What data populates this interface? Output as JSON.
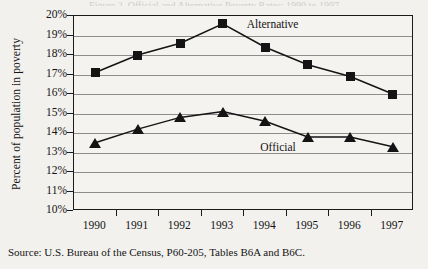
{
  "figure": {
    "title_remnant": "Figure 2. Official and Alternative Poverty Rates: 1990 to 1997",
    "source": "Source: U.S. Bureau of the Census, P60-205, Tables B6A and B6C."
  },
  "chart_data": {
    "type": "line",
    "title": "",
    "xlabel": "",
    "ylabel": "Percent of population in poverty",
    "categories": [
      "1990",
      "1991",
      "1992",
      "1993",
      "1994",
      "1995",
      "1996",
      "1997"
    ],
    "ylim": [
      10,
      20
    ],
    "ytick_labels": [
      "20%",
      "19%",
      "18%",
      "17%",
      "16%",
      "15%",
      "14%",
      "13%",
      "12%",
      "11%",
      "10%"
    ],
    "ytick_values": [
      20,
      19,
      18,
      17,
      16,
      15,
      14,
      13,
      12,
      11,
      10
    ],
    "grid": true,
    "legend_position": "inline-annotations",
    "series": [
      {
        "name": "Alternative",
        "marker": "square",
        "color": "#141414",
        "values": [
          17.1,
          18.0,
          18.6,
          19.6,
          18.4,
          17.5,
          16.9,
          16.0
        ],
        "label_text": "Alternative"
      },
      {
        "name": "Official",
        "marker": "triangle",
        "color": "#141414",
        "values": [
          13.5,
          14.2,
          14.8,
          15.1,
          14.6,
          13.8,
          13.8,
          13.3
        ],
        "label_text": "Official"
      }
    ]
  }
}
